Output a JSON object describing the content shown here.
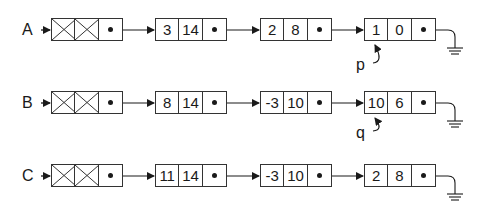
{
  "diagram": {
    "type": "linked-lists",
    "lists": [
      {
        "name": "A",
        "header": true,
        "nodes": [
          {
            "coef": "3",
            "exp": "14"
          },
          {
            "coef": "2",
            "exp": "8"
          },
          {
            "coef": "1",
            "exp": "0"
          }
        ],
        "pointer": {
          "label": "p",
          "target_node": 3
        },
        "terminator": "ground"
      },
      {
        "name": "B",
        "header": true,
        "nodes": [
          {
            "coef": "8",
            "exp": "14"
          },
          {
            "coef": "-3",
            "exp": "10"
          },
          {
            "coef": "10",
            "exp": "6"
          }
        ],
        "pointer": {
          "label": "q",
          "target_node": 3
        },
        "terminator": "ground"
      },
      {
        "name": "C",
        "header": true,
        "nodes": [
          {
            "coef": "11",
            "exp": "14"
          },
          {
            "coef": "-3",
            "exp": "10"
          },
          {
            "coef": "2",
            "exp": "8"
          }
        ],
        "terminator": "ground"
      }
    ]
  }
}
